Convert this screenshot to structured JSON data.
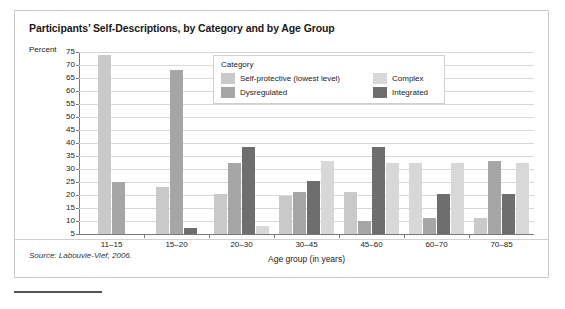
{
  "figure": {
    "title": "Participants’ Self-Descriptions, by Category and by Age Group",
    "source_note": "Source: Labouvie-Vief, 2006.",
    "y_axis_title": "Percent"
  },
  "legend": {
    "title": "Category",
    "entries": [
      {
        "label": "Self-protective (lowest level)",
        "color": "#c9c9c9"
      },
      {
        "label": "Complex",
        "color": "#d8d8d8"
      },
      {
        "label": "Dysregulated",
        "color": "#a6a6a6"
      },
      {
        "label": "Integrated",
        "color": "#6e6e6e"
      }
    ]
  },
  "chart_data": {
    "type": "bar",
    "title": "Participants’ Self-Descriptions, by Category and by Age Group",
    "xlabel": "Age group (in years)",
    "ylabel": "Percent",
    "ylim": [
      5,
      75
    ],
    "yticks": [
      75,
      70,
      65,
      60,
      55,
      50,
      45,
      40,
      35,
      30,
      25,
      20,
      15,
      10,
      5
    ],
    "grid": true,
    "legend_position": "inside-top-center",
    "categories": [
      "11–15",
      "15–20",
      "20–30",
      "30–45",
      "45–60",
      "60–70",
      "70–85"
    ],
    "series": [
      {
        "name": "Self-protective (lowest level)",
        "color": "#c9c9c9",
        "values": [
          74,
          23,
          20.5,
          19.5,
          21,
          null,
          11
        ]
      },
      {
        "name": "Dysregulated",
        "color": "#a6a6a6",
        "values": [
          25,
          68,
          32.5,
          21,
          10,
          11,
          33
        ]
      },
      {
        "name": "Integrated",
        "color": "#6e6e6e",
        "values": [
          null,
          7.5,
          38.5,
          25.5,
          38.5,
          20.5,
          20.5
        ]
      },
      {
        "name": "Complex",
        "color": "#d8d8d8",
        "values": [
          null,
          null,
          8,
          33,
          32.5,
          32.5,
          32.5
        ]
      }
    ],
    "groups": [
      {
        "category": "11–15",
        "bars": [
          {
            "series": "Self-protective (lowest level)",
            "value": 74,
            "color": "#c9c9c9"
          },
          {
            "series": "Dysregulated",
            "value": 25,
            "color": "#a6a6a6"
          }
        ]
      },
      {
        "category": "15–20",
        "bars": [
          {
            "series": "Self-protective (lowest level)",
            "value": 23,
            "color": "#c9c9c9"
          },
          {
            "series": "Dysregulated",
            "value": 68,
            "color": "#a6a6a6"
          },
          {
            "series": "Integrated",
            "value": 7.5,
            "color": "#6e6e6e"
          }
        ]
      },
      {
        "category": "20–30",
        "bars": [
          {
            "series": "Self-protective (lowest level)",
            "value": 20.5,
            "color": "#c9c9c9"
          },
          {
            "series": "Dysregulated",
            "value": 32.5,
            "color": "#a6a6a6"
          },
          {
            "series": "Integrated",
            "value": 38.5,
            "color": "#6e6e6e"
          },
          {
            "series": "Complex",
            "value": 8,
            "color": "#d8d8d8"
          }
        ]
      },
      {
        "category": "30–45",
        "bars": [
          {
            "series": "Self-protective (lowest level)",
            "value": 19.5,
            "color": "#c9c9c9"
          },
          {
            "series": "Dysregulated",
            "value": 21,
            "color": "#a6a6a6"
          },
          {
            "series": "Integrated",
            "value": 25.5,
            "color": "#6e6e6e"
          },
          {
            "series": "Complex",
            "value": 33,
            "color": "#d8d8d8"
          }
        ]
      },
      {
        "category": "45–60",
        "bars": [
          {
            "series": "Self-protective (lowest level)",
            "value": 21,
            "color": "#c9c9c9"
          },
          {
            "series": "Dysregulated",
            "value": 10,
            "color": "#a6a6a6"
          },
          {
            "series": "Integrated",
            "value": 38.5,
            "color": "#6e6e6e"
          },
          {
            "series": "Complex",
            "value": 32.5,
            "color": "#d8d8d8"
          }
        ]
      },
      {
        "category": "60–70",
        "bars": [
          {
            "series": "Complex",
            "value": 32.5,
            "color": "#d8d8d8"
          },
          {
            "series": "Dysregulated",
            "value": 11,
            "color": "#a6a6a6"
          },
          {
            "series": "Integrated",
            "value": 20.5,
            "color": "#6e6e6e"
          },
          {
            "series": "Complex",
            "value": 32.5,
            "color": "#d8d8d8"
          }
        ]
      },
      {
        "category": "70–85",
        "bars": [
          {
            "series": "Self-protective (lowest level)",
            "value": 11,
            "color": "#c9c9c9"
          },
          {
            "series": "Dysregulated",
            "value": 33,
            "color": "#a6a6a6"
          },
          {
            "series": "Integrated",
            "value": 20.5,
            "color": "#6e6e6e"
          },
          {
            "series": "Complex",
            "value": 32.5,
            "color": "#d8d8d8"
          }
        ]
      }
    ]
  }
}
